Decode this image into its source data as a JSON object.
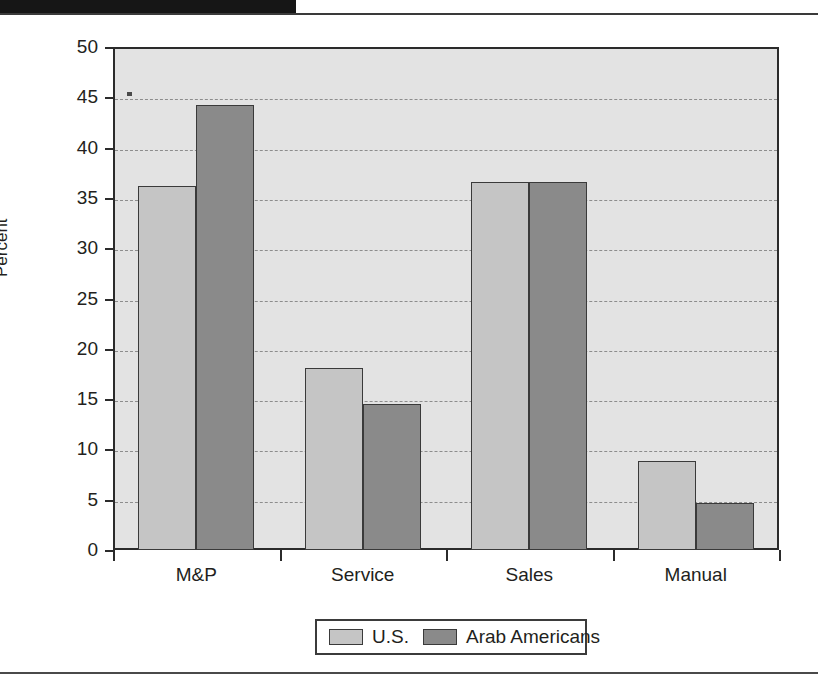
{
  "page": {
    "header_bar_name": "black-header-bar",
    "rule_top_name": "top-horizontal-rule",
    "rule_bottom_name": "bottom-horizontal-rule"
  },
  "chart_data": {
    "type": "bar",
    "title": "",
    "subtitle": "",
    "xlabel": "",
    "ylabel": "Percent",
    "categories": [
      "M&P",
      "Service",
      "Sales",
      "Manual"
    ],
    "series": [
      {
        "name": "U.S.",
        "values": [
          36.2,
          18.1,
          36.6,
          8.8
        ],
        "color": "#c5c5c5"
      },
      {
        "name": "Arab Americans",
        "values": [
          44.2,
          14.5,
          36.6,
          4.7
        ],
        "color": "#8a8a8a"
      }
    ],
    "ylim": [
      0,
      50
    ],
    "ytick_values": [
      0,
      5,
      10,
      15,
      20,
      25,
      30,
      35,
      40,
      45,
      50
    ],
    "ytick_labels": [
      "0",
      "5",
      "10",
      "15",
      "20",
      "25",
      "30",
      "35",
      "40",
      "45",
      "50"
    ],
    "grid": true,
    "grid_style": "dashed",
    "legend_position": "bottom",
    "plot_background": "#e3e3e3",
    "axis_color": "#2b2b2b"
  },
  "legend": {
    "entries": [
      {
        "label": "U.S.",
        "color": "#c5c5c5"
      },
      {
        "label": "Arab Americans",
        "color": "#8a8a8a"
      }
    ]
  }
}
